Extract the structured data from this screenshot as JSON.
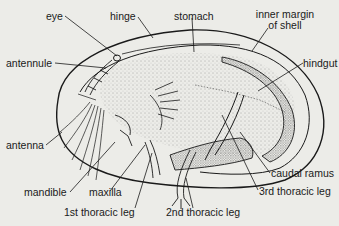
{
  "diagram": {
    "colors": {
      "background": "#ecece8",
      "ink": "#1a1a1a",
      "stipple": "#555555"
    },
    "labels": {
      "eye": "eye",
      "hinge": "hinge",
      "stomach": "stomach",
      "inner_margin_line1": "inner margin",
      "inner_margin_line2": "of shell",
      "antennule": "antennule",
      "hindgut": "hindgut",
      "antenna": "antenna",
      "caudal_ramus": "caudal ramus",
      "mandible": "mandible",
      "maxilla": "maxilla",
      "third_thoracic_leg": "3rd thoracic leg",
      "first_thoracic_leg": "1st thoracic leg",
      "second_thoracic_leg": "2nd thoracic leg"
    }
  }
}
